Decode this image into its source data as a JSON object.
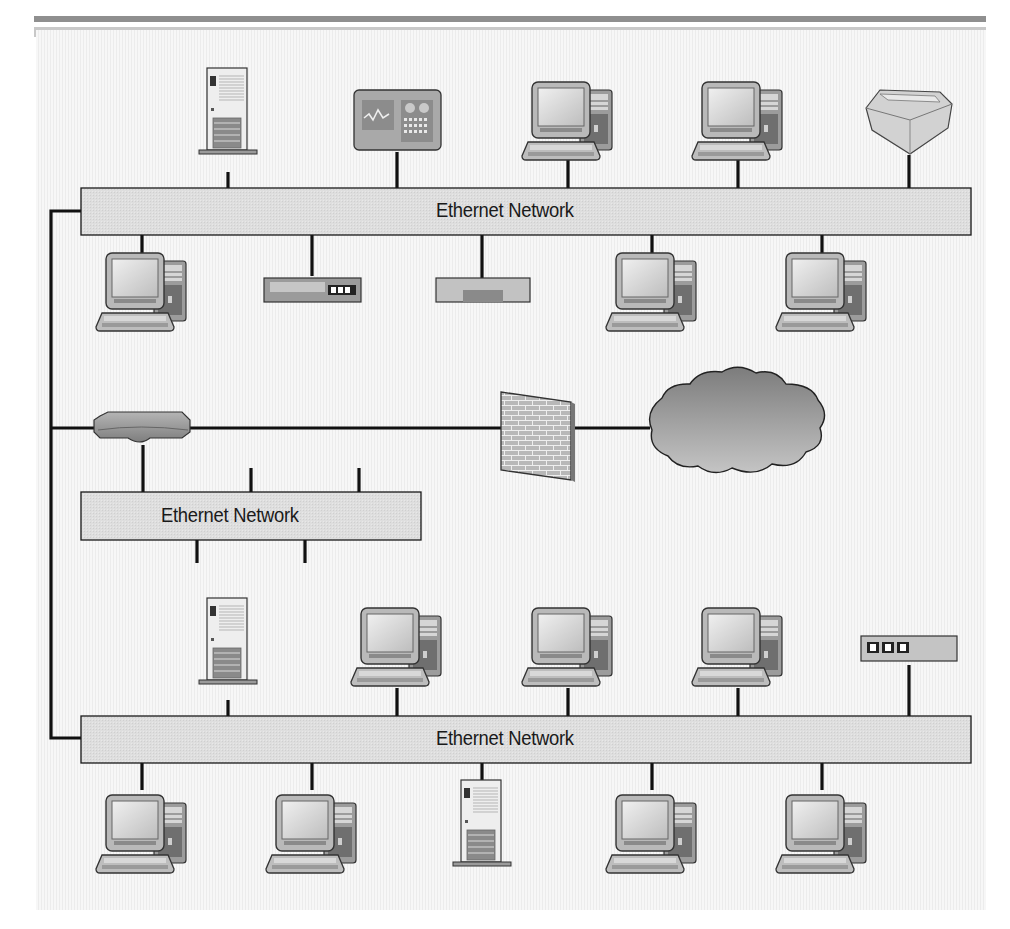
{
  "diagram": {
    "type": "network-topology",
    "colors": {
      "bus_fill": "#dcdcdc",
      "bus_stroke": "#1a1a1a",
      "wire": "#111111",
      "background": "#f2f2f2",
      "device_gray": "#b0b0b0",
      "cloud": "#9a9a9a"
    },
    "networks": [
      {
        "id": "net-top",
        "label": "Ethernet Network"
      },
      {
        "id": "net-middle",
        "label": "Ethernet Network"
      },
      {
        "id": "net-bottom",
        "label": "Ethernet Network"
      }
    ],
    "devices": {
      "top_network_above": [
        "tower-server-icon",
        "control-panel-icon",
        "workstation-icon",
        "workstation-icon",
        "printer-icon"
      ],
      "top_network_below": [
        "workstation-icon",
        "hub-icon",
        "switch-icon",
        "workstation-icon",
        "workstation-icon"
      ],
      "backbone": [
        "router-icon",
        "firewall-icon",
        "internet-cloud-icon"
      ],
      "bottom_network_above": [
        "tower-server-icon",
        "workstation-icon",
        "workstation-icon",
        "workstation-icon",
        "hub-icon"
      ],
      "bottom_network_below": [
        "workstation-icon",
        "workstation-icon",
        "tower-server-icon",
        "workstation-icon",
        "workstation-icon"
      ]
    }
  }
}
